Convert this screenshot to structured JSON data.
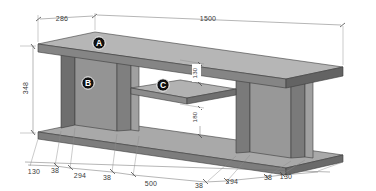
{
  "drawing": {
    "title": "Media console isometric dimensioned drawing",
    "units": "mm",
    "object_name": "TV stand / media console"
  },
  "callouts": [
    {
      "id": "A",
      "label": "A",
      "part": "top-panel",
      "cx": 99,
      "cy": 43
    },
    {
      "id": "B",
      "label": "B",
      "part": "left-side-panel",
      "cx": 88,
      "cy": 83
    },
    {
      "id": "C",
      "label": "C",
      "part": "middle-shelf",
      "cx": 163,
      "cy": 85
    }
  ],
  "dimensions": {
    "top": [
      {
        "name": "top-offset",
        "value": "286",
        "x": 62,
        "y": 21
      },
      {
        "name": "overall-length",
        "value": "1500",
        "x": 208,
        "y": 21
      }
    ],
    "left": [
      {
        "name": "overall-height",
        "value": "348",
        "x": 28,
        "y": 88
      }
    ],
    "interior": [
      {
        "name": "upper-compartment-height",
        "value": "130",
        "x": 196,
        "y": 78
      },
      {
        "name": "lower-compartment-height",
        "value": "180",
        "x": 196,
        "y": 118
      }
    ],
    "bottom": [
      {
        "name": "base-left-overhang",
        "value": "130",
        "x": 34,
        "y": 174
      },
      {
        "name": "left-panel-thickness",
        "value": "38",
        "x": 55,
        "y": 173
      },
      {
        "name": "left-bay-width",
        "value": "294",
        "x": 80,
        "y": 178
      },
      {
        "name": "divider-1-thickness",
        "value": "38",
        "x": 107,
        "y": 180
      },
      {
        "name": "center-bay-width",
        "value": "500",
        "x": 151,
        "y": 186
      },
      {
        "name": "divider-2-thickness",
        "value": "38",
        "x": 199,
        "y": 188
      },
      {
        "name": "right-bay-width",
        "value": "294",
        "x": 232,
        "y": 184
      },
      {
        "name": "right-panel-thickness",
        "value": "38",
        "x": 268,
        "y": 180
      },
      {
        "name": "base-right-overhang",
        "value": "130",
        "x": 286,
        "y": 179
      }
    ]
  },
  "colors": {
    "face_light": "#b4b4b4",
    "face_mid": "#949494",
    "face_dark": "#7b7b7b",
    "face_darker": "#5f5f5f",
    "edge": "#3c3c3c",
    "dim_line": "#6d6d6d",
    "text": "#3a3a3a",
    "callout_fill": "#111111",
    "background": "#ffffff"
  }
}
